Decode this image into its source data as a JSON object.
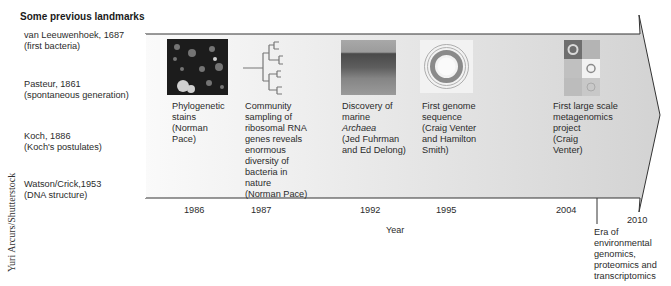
{
  "header": {
    "title": "Some previous landmarks"
  },
  "landmarks": [
    {
      "line1": "van Leeuwenhoek, 1687",
      "line2": "(first bacteria)"
    },
    {
      "line1": "Pasteur, 1861",
      "line2": "(spontaneous generation)"
    },
    {
      "line1": "Koch, 1886",
      "line2": "(Koch's postulates)"
    },
    {
      "line1": "Watson/Crick,1953",
      "line2": "(DNA structure)"
    }
  ],
  "credit": "Yuri Arcurs/Shutterstock",
  "timeline": {
    "axis_label": "Year",
    "events": [
      {
        "year": "1986",
        "image": "stained-cells-micrograph",
        "lines": [
          "Phylogenetic",
          "stains",
          "(Norman",
          "Pace)"
        ]
      },
      {
        "year": "1987",
        "image": "phylogenetic-tree",
        "lines": [
          "Community",
          "sampling of",
          "ribosomal RNA",
          "genes reveals",
          "enormous",
          "diversity of",
          "bacteria in",
          "nature",
          "(Norman Pace)"
        ]
      },
      {
        "year": "1992",
        "image": "ocean-horizon",
        "lines": [
          "Discovery of",
          "marine",
          "Archaea",
          "(Jed Fuhrman",
          "and Ed Delong)"
        ]
      },
      {
        "year": "1995",
        "image": "circular-genome-map",
        "lines": [
          "First genome",
          "sequence",
          "(Craig Venter",
          "and Hamilton",
          "Smith)"
        ]
      },
      {
        "year": "2004",
        "image": "metagenomics-genome-grid",
        "lines": [
          "First large scale",
          "metagenomics",
          "project",
          "(Craig",
          "Venter)"
        ]
      }
    ],
    "end_year": "2010",
    "era": {
      "lines": [
        "Era of",
        "environmental",
        "genomics,",
        "proteomics and",
        "transcriptomics"
      ]
    }
  },
  "colors": {
    "arrow_fill_left": "#f7f7f7",
    "arrow_fill_right": "#d6d6d6",
    "outline": "#333333"
  }
}
